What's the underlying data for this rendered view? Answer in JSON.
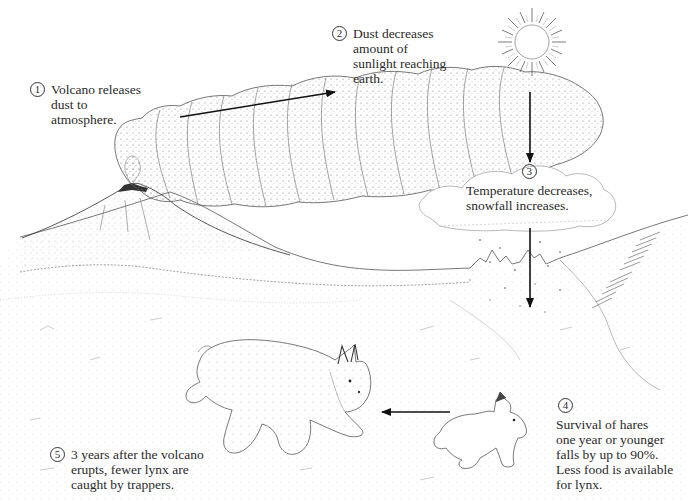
{
  "diagram": {
    "title": "",
    "steps": [
      {
        "number": "1",
        "text": "Volcano releases\ndust to\natmosphere."
      },
      {
        "number": "2",
        "text": "Dust decreases\namount of\nsunlight reaching\nearth."
      },
      {
        "number": "3",
        "text": "Temperature decreases,\nsnowfall increases."
      },
      {
        "number": "4",
        "text": "Survival of hares\none year or younger\nfalls by up to 90%.\nLess food is available\nfor lynx."
      },
      {
        "number": "5",
        "text": "3 years after the volcano\nerupts, fewer lynx are\ncaught by trappers."
      }
    ],
    "elements": [
      {
        "name": "volcano",
        "description": "erupting volcano on the left horizon"
      },
      {
        "name": "dust-plume",
        "description": "billowing dust cloud rising from the volcano toward the sun"
      },
      {
        "name": "sun",
        "description": "sun with radiating rays, top right"
      },
      {
        "name": "snow-cloud",
        "description": "cloud dropping snowflakes"
      },
      {
        "name": "hare",
        "description": "snowshoe hare"
      },
      {
        "name": "lynx",
        "description": "Canada lynx crouching"
      }
    ],
    "arrows": [
      {
        "from": "step-1",
        "to": "step-2",
        "direction": "up-right"
      },
      {
        "from": "sun",
        "to": "step-3",
        "direction": "down"
      },
      {
        "from": "step-3",
        "to": "landscape",
        "direction": "down"
      },
      {
        "from": "hare",
        "to": "lynx",
        "direction": "left"
      }
    ],
    "colors": {
      "ink": "#222222",
      "stipple": "#8a8a8a",
      "background": "#ffffff"
    }
  }
}
